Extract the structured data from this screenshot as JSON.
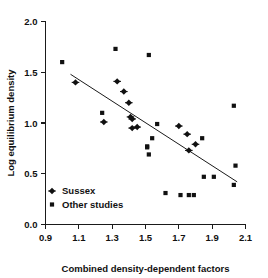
{
  "chart_data": {
    "type": "scatter",
    "title": "",
    "xlabel": "Combined density-dependent factors",
    "ylabel": "Log equilibrium density",
    "xlim": [
      0.9,
      2.1
    ],
    "ylim": [
      0.0,
      2.0
    ],
    "xticks": [
      "0.9",
      "1.1",
      "1.3",
      "1.5",
      "1.7",
      "1.9",
      "2.1"
    ],
    "xtick_values": [
      0.9,
      1.1,
      1.3,
      1.5,
      1.7,
      1.9,
      2.1
    ],
    "yticks": [
      "0.0",
      "0.5",
      "1.0",
      "1.5",
      "2.0"
    ],
    "ytick_values": [
      0.0,
      0.5,
      1.0,
      1.5,
      2.0
    ],
    "grid": false,
    "legend_position": "lower-left",
    "series": [
      {
        "name": "Sussex",
        "marker": "diamond",
        "color": "#111111",
        "points": [
          [
            1.08,
            1.4
          ],
          [
            1.25,
            1.01
          ],
          [
            1.33,
            1.41
          ],
          [
            1.37,
            1.31
          ],
          [
            1.4,
            1.2
          ],
          [
            1.41,
            1.06
          ],
          [
            1.42,
            1.04
          ],
          [
            1.42,
            0.95
          ],
          [
            1.45,
            0.96
          ],
          [
            1.7,
            0.97
          ],
          [
            1.75,
            0.89
          ],
          [
            1.76,
            0.73
          ],
          [
            1.8,
            0.79
          ]
        ]
      },
      {
        "name": "Other studies",
        "marker": "square",
        "color": "#111111",
        "points": [
          [
            1.0,
            1.6
          ],
          [
            1.24,
            1.1
          ],
          [
            1.32,
            1.73
          ],
          [
            1.52,
            1.67
          ],
          [
            1.51,
            0.77
          ],
          [
            1.51,
            0.76
          ],
          [
            1.52,
            0.69
          ],
          [
            1.54,
            0.85
          ],
          [
            1.57,
            0.99
          ],
          [
            1.62,
            0.31
          ],
          [
            1.71,
            0.29
          ],
          [
            1.76,
            0.29
          ],
          [
            1.79,
            0.29
          ],
          [
            1.84,
            0.85
          ],
          [
            1.85,
            0.47
          ],
          [
            1.91,
            0.47
          ],
          [
            2.03,
            1.17
          ],
          [
            2.04,
            0.58
          ],
          [
            2.03,
            0.39
          ]
        ]
      }
    ],
    "trend_line": {
      "name": "regression-line",
      "x_start": 1.05,
      "y_start": 1.48,
      "x_end": 2.05,
      "y_end": 0.42,
      "slope": -1.06,
      "intercept": 2.593
    }
  },
  "legend": {
    "entries": [
      {
        "label": "Sussex",
        "marker": "diamond"
      },
      {
        "label": "Other studies",
        "marker": "square"
      }
    ]
  }
}
